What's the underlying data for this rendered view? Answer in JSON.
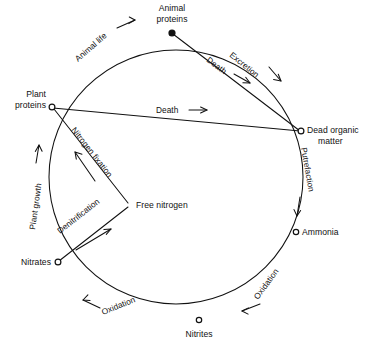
{
  "figure": {
    "background_color": "#ffffff",
    "ink_color": "#111111"
  },
  "nodes": [
    {
      "id": "animal-proteins",
      "label_line1": "Animal",
      "label_line2": "proteins",
      "marker": "filled-dot",
      "x": 172,
      "y": 33,
      "label_x": 172,
      "label_y": 12,
      "anchor": "middle"
    },
    {
      "id": "plant-proteins",
      "label_line1": "Plant",
      "label_line2": "proteins",
      "marker": "open-circle",
      "x": 52,
      "y": 107,
      "label_x": 46,
      "label_y": 97,
      "anchor": "end"
    },
    {
      "id": "dead-organic-matter",
      "label_line1": "Dead organic",
      "label_line2": "matter",
      "marker": "open-circle",
      "x": 301,
      "y": 131,
      "label_x": 308,
      "label_y": 134,
      "anchor": "start"
    },
    {
      "id": "ammonia",
      "label_line1": "Ammonia",
      "label_line2": "",
      "marker": "open-circle",
      "x": 296,
      "y": 232,
      "label_x": 303,
      "label_y": 235,
      "anchor": "start"
    },
    {
      "id": "nitrites",
      "label_line1": "Nitrites",
      "label_line2": "",
      "marker": "open-circle",
      "x": 199,
      "y": 320,
      "label_x": 199,
      "label_y": 337,
      "anchor": "middle"
    },
    {
      "id": "nitrates",
      "label_line1": "Nitrates",
      "label_line2": "",
      "marker": "open-circle",
      "x": 58,
      "y": 262,
      "label_x": 51,
      "label_y": 265,
      "anchor": "end"
    },
    {
      "id": "free-nitrogen",
      "label_line1": "Free nitrogen",
      "label_line2": "",
      "marker": "none",
      "x": 130,
      "y": 205,
      "label_x": 135,
      "label_y": 208,
      "anchor": "start"
    }
  ],
  "edges": [
    {
      "id": "animal-life",
      "label": "Animal life",
      "from": "plant-proteins",
      "to": "animal-proteins",
      "kind": "arc"
    },
    {
      "id": "excretion",
      "label": "Excretion",
      "from": "animal-proteins",
      "to": "dead-organic-matter",
      "kind": "arc"
    },
    {
      "id": "death-chord-upper",
      "label": "Death",
      "from": "animal-proteins",
      "to": "dead-organic-matter",
      "kind": "chord"
    },
    {
      "id": "death-chord-lower",
      "label": "Death",
      "from": "plant-proteins",
      "to": "dead-organic-matter",
      "kind": "chord"
    },
    {
      "id": "putrefaction",
      "label": "Putrefaction",
      "from": "dead-organic-matter",
      "to": "ammonia",
      "kind": "arc"
    },
    {
      "id": "oxidation-ammonia",
      "label": "Oxidation",
      "from": "ammonia",
      "to": "nitrites",
      "kind": "arc"
    },
    {
      "id": "oxidation-nitrites",
      "label": "Oxidation",
      "from": "nitrites",
      "to": "nitrates",
      "kind": "arc"
    },
    {
      "id": "plant-growth",
      "label": "Plant growth",
      "from": "nitrates",
      "to": "plant-proteins",
      "kind": "arc"
    },
    {
      "id": "nitrogen-fixation",
      "label": "Nitrogen fixation",
      "from": "free-nitrogen",
      "to": "plant-proteins",
      "kind": "straight"
    },
    {
      "id": "denitrification",
      "label": "Denitrification",
      "from": "nitrates",
      "to": "free-nitrogen",
      "kind": "straight"
    }
  ],
  "labels": {
    "animal_proteins_l1": "Animal",
    "animal_proteins_l2": "proteins",
    "plant_proteins_l1": "Plant",
    "plant_proteins_l2": "proteins",
    "dead_organic_l1": "Dead organic",
    "dead_organic_l2": "matter",
    "ammonia": "Ammonia",
    "nitrites": "Nitrites",
    "nitrates": "Nitrates",
    "free_nitrogen": "Free nitrogen",
    "animal_life": "Animal life",
    "excretion": "Excretion",
    "death_upper": "Death",
    "death_lower": "Death",
    "putrefaction": "Putrefaction",
    "oxidation_right": "Oxidation",
    "oxidation_bottom": "Oxidation",
    "plant_growth": "Plant growth",
    "nitrogen_fixation": "Nitrogen fixation",
    "denitrification": "Denitrification"
  },
  "geometry": {
    "circle_center_x": 176,
    "circle_center_y": 177,
    "circle_radius": 127
  }
}
